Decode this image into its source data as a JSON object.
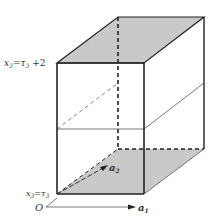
{
  "diagram": {
    "type": "parallelepiped",
    "colors": {
      "face_fill": "#c9c9c9",
      "edge": "#222222",
      "thin_line": "#555555"
    },
    "labels": {
      "top_plane": {
        "var": "x",
        "sub": "3",
        "eq": "=",
        "rhs": "τ",
        "rhs_sub": "3",
        "tail": " +2"
      },
      "bottom_plane": {
        "var": "x",
        "sub": "3",
        "eq": "=",
        "rhs": "τ",
        "rhs_sub": "3"
      },
      "origin": "O",
      "vec_a1": {
        "base": "a",
        "sub": "1"
      },
      "vec_a2": {
        "base": "a",
        "sub": "2"
      }
    }
  }
}
